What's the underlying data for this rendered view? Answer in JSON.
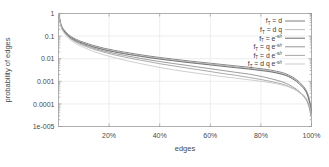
{
  "chart_data": {
    "type": "line",
    "title": "",
    "xlabel": "edges",
    "ylabel": "probability of edges",
    "xlim": [
      0,
      100
    ],
    "ylim": [
      1e-05,
      1
    ],
    "yscale": "log",
    "grid": true,
    "legend_position": "top-right",
    "xticks": [
      "20%",
      "40%",
      "60%",
      "80%",
      "100%"
    ],
    "xtick_values": [
      20,
      40,
      60,
      80,
      100
    ],
    "yticks": [
      "1",
      "0.1",
      "0.01",
      "0.001",
      "0.0001",
      "1e-005"
    ],
    "ytick_values": [
      1,
      0.1,
      0.01,
      0.001,
      0.0001,
      1e-05
    ],
    "x": [
      0,
      1,
      2,
      4,
      6,
      8,
      10,
      14,
      18,
      22,
      26,
      30,
      35,
      40,
      45,
      50,
      55,
      60,
      65,
      70,
      75,
      80,
      84,
      88,
      91,
      94,
      96,
      97.5,
      98.5,
      99.2,
      99.7,
      100
    ],
    "series": [
      {
        "name": "f_T = d",
        "label_base": "f",
        "label_sub": "T",
        "label_rest": " = d",
        "color": "#6e6e6e",
        "values": [
          1,
          0.33,
          0.2,
          0.115,
          0.082,
          0.064,
          0.053,
          0.038,
          0.029,
          0.0235,
          0.0195,
          0.0165,
          0.0135,
          0.0113,
          0.0097,
          0.0083,
          0.0072,
          0.0063,
          0.0055,
          0.0048,
          0.0042,
          0.0036,
          0.0031,
          0.0025,
          0.0019,
          0.0012,
          0.00075,
          0.00048,
          0.00028,
          0.00015,
          7e-05,
          2.8e-05
        ]
      },
      {
        "name": "f_T = d q",
        "label_base": "f",
        "label_sub": "T",
        "label_rest": " = d q",
        "color": "#b4b4b4",
        "values": [
          1,
          0.31,
          0.185,
          0.105,
          0.075,
          0.058,
          0.048,
          0.0345,
          0.0265,
          0.0215,
          0.0178,
          0.0151,
          0.0124,
          0.0104,
          0.0089,
          0.0076,
          0.0066,
          0.0058,
          0.0051,
          0.0044,
          0.0038,
          0.0033,
          0.0028,
          0.0022,
          0.0017,
          0.0011,
          0.0007,
          0.00045,
          0.00026,
          0.00014,
          6.5e-05,
          2.7e-05
        ]
      },
      {
        "name": "f_T = e^(-s/r)",
        "label_base": "f",
        "label_sub": "T",
        "label_rest": " = e",
        "label_exp": "-s/r",
        "color": "#5a5a5a",
        "values": [
          1,
          0.3,
          0.178,
          0.1,
          0.072,
          0.056,
          0.046,
          0.0325,
          0.0248,
          0.02,
          0.0165,
          0.014,
          0.0115,
          0.0096,
          0.0082,
          0.007,
          0.0061,
          0.0053,
          0.0046,
          0.004,
          0.0035,
          0.003,
          0.0026,
          0.0021,
          0.0016,
          0.001,
          0.00062,
          0.0004,
          0.00023,
          0.00012,
          6e-05,
          2.6e-05
        ]
      },
      {
        "name": "f_T = q e^(-s/r)",
        "label_base": "f",
        "label_sub": "T",
        "label_rest": " = q e",
        "label_exp": "-s/r",
        "color": "#8a8a8a",
        "values": [
          1,
          0.29,
          0.17,
          0.094,
          0.066,
          0.051,
          0.0415,
          0.029,
          0.0218,
          0.0172,
          0.014,
          0.0116,
          0.0092,
          0.0075,
          0.0062,
          0.0052,
          0.0043,
          0.0036,
          0.003,
          0.0025,
          0.0021,
          0.00165,
          0.0013,
          0.00098,
          0.00072,
          0.00045,
          0.00029,
          0.00019,
          0.00012,
          7e-05,
          4e-05,
          2.5e-05
        ]
      },
      {
        "name": "f_T = d e^(-s/r)",
        "label_base": "f",
        "label_sub": "T",
        "label_rest": " = d e",
        "label_exp": "-s/r",
        "color": "#9c9c9c",
        "values": [
          1,
          0.28,
          0.162,
          0.089,
          0.062,
          0.047,
          0.0378,
          0.026,
          0.0192,
          0.0149,
          0.0119,
          0.0097,
          0.0076,
          0.006,
          0.0049,
          0.004,
          0.0033,
          0.0027,
          0.0022,
          0.00185,
          0.0015,
          0.0012,
          0.00098,
          0.00078,
          0.0006,
          0.0004,
          0.00027,
          0.00018,
          0.00011,
          6e-05,
          3.5e-05,
          2.4e-05
        ]
      },
      {
        "name": "f_T = d q e^(-s/r)",
        "label_base": "f",
        "label_sub": "T",
        "label_rest": " = d q e",
        "label_exp": "-s/r",
        "color": "#c6c6c6",
        "values": [
          1,
          0.265,
          0.15,
          0.08,
          0.054,
          0.04,
          0.0315,
          0.0208,
          0.0148,
          0.0112,
          0.0087,
          0.0069,
          0.0053,
          0.0041,
          0.0033,
          0.0027,
          0.00225,
          0.0019,
          0.0016,
          0.00138,
          0.00118,
          0.001,
          0.00086,
          0.0007,
          0.00056,
          0.0004,
          0.00029,
          0.00021,
          0.00014,
          9e-05,
          5e-05,
          2.6e-05
        ]
      }
    ]
  }
}
